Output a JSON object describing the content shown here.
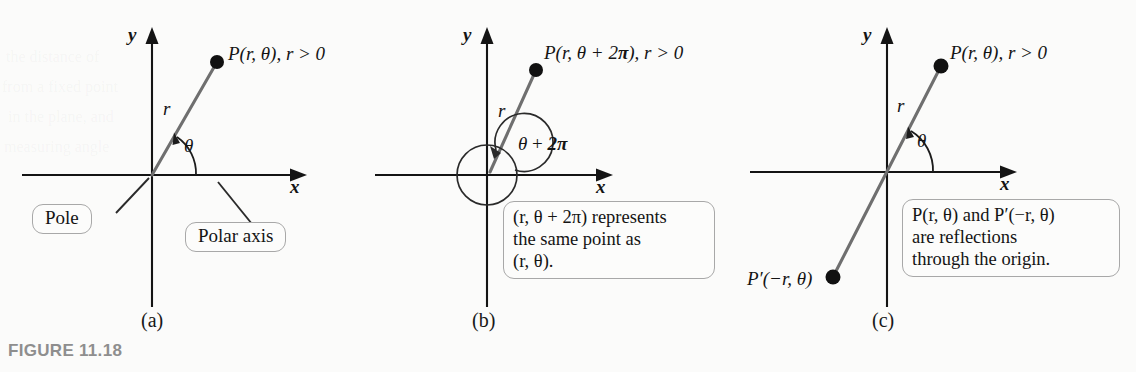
{
  "figure": {
    "caption": "FIGURE 11.18",
    "background_color": "#fbfbfa",
    "axis_color": "#141414",
    "ray_color": "#6f6f6f",
    "callout_border_color": "#a8a8a8",
    "caption_color": "#8e8e8e"
  },
  "panels": [
    {
      "letter": "(a)",
      "axis_x_label": "x",
      "axis_y_label": "y",
      "radius_label": "r",
      "angle_label": "θ",
      "point_label": "P(r, θ), r > 0",
      "callouts": [
        {
          "name": "pole",
          "text": "Pole"
        },
        {
          "name": "polar-axis",
          "text": "Polar axis"
        }
      ]
    },
    {
      "letter": "(b)",
      "axis_x_label": "x",
      "axis_y_label": "y",
      "radius_label": "r",
      "angle_label_parts": {
        "theta": "θ",
        "plus": "+",
        "two_pi": "2π"
      },
      "point_label_parts": {
        "lead": "P(r, θ + 2",
        "pi": "π",
        "tail": "), r > 0"
      },
      "callouts": [
        {
          "name": "same-point",
          "lines": [
            "(r, θ + 2π) represents",
            "the same point as",
            "(r, θ)."
          ]
        }
      ]
    },
    {
      "letter": "(c)",
      "axis_x_label": "x",
      "axis_y_label": "y",
      "radius_label": "r",
      "angle_label": "θ",
      "point_label": "P(r, θ), r > 0",
      "reflected_point_label": "P′(−r, θ)",
      "callouts": [
        {
          "name": "reflection",
          "lines": [
            "P(r, θ) and P′(−r, θ)",
            "are reflections",
            "through the origin."
          ]
        }
      ]
    }
  ],
  "ghost_text": [
    "the distance of",
    "from a fixed point",
    "in the plane, and",
    "measuring angle"
  ]
}
